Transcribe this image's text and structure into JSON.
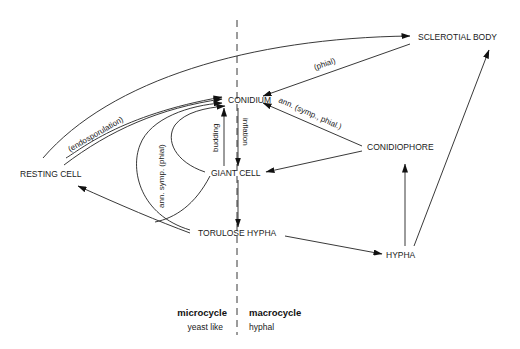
{
  "nodes": {
    "sclerotial_body": "SCLEROTIAL BODY",
    "conidium": "CONIDIUM",
    "conidiophore": "CONIDIOPHORE",
    "resting_cell": "RESTING CELL",
    "giant_cell": "GIANT CELL",
    "torulose_hypha": "TORULOSE HYPHA",
    "hypha": "HYPHA"
  },
  "edge_labels": {
    "phial": "(phial)",
    "ann_symp_phial": "ann. (symp., phial.)",
    "endosporulation": "(endosporulation)",
    "ann_symp_phial_vertical": "ann. symp. (phial)",
    "budding": "budding",
    "inflation": "inflation"
  },
  "legend": {
    "left_title": "microcycle",
    "left_sub": "yeast like",
    "right_title": "macrocycle",
    "right_sub": "hyphal"
  }
}
